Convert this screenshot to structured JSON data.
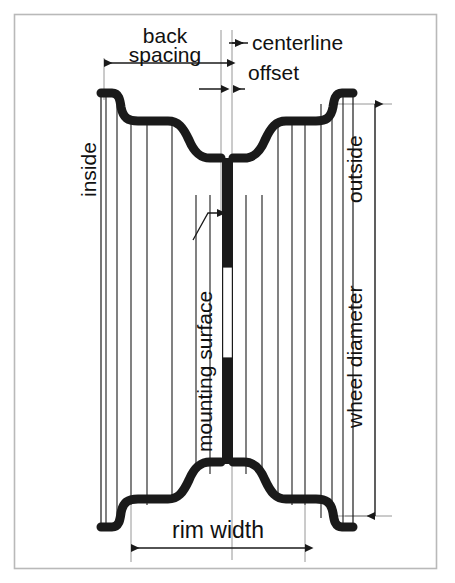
{
  "figure": {
    "kind": "technical-cross-section-diagram",
    "background_color": "#ffffff",
    "line_color": "#1a1a1a",
    "frame_color": "#b9b9b9",
    "frame": {
      "x": 14,
      "y": 14,
      "width": 423,
      "height": 555
    }
  },
  "labels": {
    "back_spacing": "back\nspacing",
    "back_spacing_line1": "back",
    "back_spacing_line2": "spacing",
    "centerline": "centerline",
    "offset": "offset",
    "inside": "inside",
    "outside": "outside",
    "wheel_diameter": "wheel diameter",
    "mounting_surface": "mounting surface",
    "rim_width": "rim width"
  },
  "dimensions": [
    {
      "name": "back-spacing",
      "label": "back spacing",
      "orientation": "horizontal",
      "arrow_ends": "both",
      "from_x": 104,
      "to_x": 227,
      "y": 63
    },
    {
      "name": "offset",
      "label": "offset",
      "orientation": "horizontal",
      "arrow_ends": "both-inward",
      "from_x": 199,
      "to_x": 245,
      "y": 89
    },
    {
      "name": "wheel-diameter",
      "label": "wheel diameter",
      "orientation": "vertical",
      "arrow_ends": "both",
      "x": 375,
      "from_y": 104,
      "to_y": 516
    },
    {
      "name": "rim-width",
      "label": "rim width",
      "orientation": "horizontal",
      "arrow_ends": "both",
      "from_x": 131,
      "to_x": 305,
      "y": 548
    }
  ],
  "leaders": [
    {
      "name": "centerline-leader",
      "label": "centerline",
      "points_to_x": 227,
      "points_to_y": 43,
      "text_x": 248,
      "text_y": 48
    },
    {
      "name": "mounting-surface-leader",
      "label": "mounting surface",
      "points_to_x": 227,
      "points_to_y": 214,
      "from_x": 195,
      "from_y": 238
    }
  ],
  "callout_sides": {
    "left": "inside",
    "right": "outside"
  },
  "geometry_notes": {
    "centerline_x": 227,
    "rim_top_y": 92,
    "rim_bottom_y": 528,
    "hub_gap_top_y": 267,
    "hub_gap_bottom_y": 358
  }
}
